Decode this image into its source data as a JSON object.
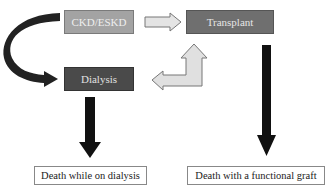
{
  "diagram": {
    "nodes": {
      "ckd": "CKD/ESKD",
      "transplant": "Transplant",
      "dialysis": "Dialysis",
      "death_dialysis": "Death while on dialysis",
      "death_graft": "Death with a functional graft"
    },
    "edges": [
      {
        "from": "CKD/ESKD",
        "to": "Transplant",
        "style": "hollow-light"
      },
      {
        "from": "CKD/ESKD",
        "to": "Dialysis",
        "style": "curved-dark"
      },
      {
        "from": "Dialysis",
        "to": "Transplant",
        "style": "bidirectional-hollow"
      },
      {
        "from": "Dialysis",
        "to": "Death while on dialysis",
        "style": "thick-black"
      },
      {
        "from": "Transplant",
        "to": "Death with a functional graft",
        "style": "thick-black"
      }
    ],
    "colors": {
      "ckd_fill": "#a3a3a3",
      "transplant_fill": "#6f6f6f",
      "dialysis_fill": "#4a4a4a",
      "arrow_dark": "#1a1a1a",
      "arrow_light": "#e2e2e2"
    }
  }
}
